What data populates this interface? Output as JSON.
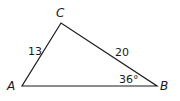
{
  "diagram": {
    "type": "triangle",
    "vertices": {
      "A": {
        "label": "A",
        "x": 22,
        "y": 86
      },
      "B": {
        "label": "B",
        "x": 157,
        "y": 86
      },
      "C": {
        "label": "C",
        "x": 61,
        "y": 23
      }
    },
    "sides": {
      "AC": {
        "label": "13"
      },
      "CB": {
        "label": "20"
      }
    },
    "angles": {
      "B": {
        "label": "36°"
      }
    },
    "stroke_color": "#1a1a1a"
  }
}
